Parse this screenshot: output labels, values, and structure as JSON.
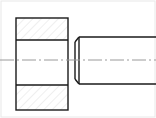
{
  "image": {
    "width": 156,
    "height": 118,
    "background_color": "#ffffff",
    "kind": "engineering-line-drawing",
    "description": "Mechanical assembly drawing: sectioned bore plate at left, chamfered cylindrical pin at right, sharing a horizontal centre axis"
  },
  "colors": {
    "outline": "#1a1a1a",
    "hatch": "#d8d8d8",
    "centerline": "#9a9a9a",
    "frame": "#e8e8e8",
    "background": "#ffffff"
  },
  "frame": {
    "label": "drawing-border",
    "x": 1,
    "y": 1,
    "width": 154,
    "height": 116,
    "stroke_width": 1
  },
  "centerline": {
    "label": "Centre axis",
    "y": 60,
    "x_start": 0,
    "x_end": 156,
    "style": "dash-dot",
    "stroke_width": 1
  },
  "parts": [
    {
      "id": "sectioned-plate",
      "label": "Sectioned plate with bore",
      "view": "full section",
      "x": 16,
      "y": 18,
      "width": 52,
      "height": 92,
      "stroke_width": 1.4,
      "bands": [
        {
          "id": "upper-section-band",
          "label": "Upper cut material",
          "y": 18,
          "height": 22,
          "hatched": true,
          "hatch_angle_deg": 45
        },
        {
          "id": "bore-band",
          "label": "Bore clearance (not hatched)",
          "y": 40,
          "height": 45,
          "hatched": false
        },
        {
          "id": "lower-section-band",
          "label": "Lower cut material",
          "y": 85,
          "height": 25,
          "hatched": true,
          "hatch_angle_deg": 45
        }
      ],
      "divider_lines_y": [
        40,
        85
      ]
    },
    {
      "id": "chamfered-pin",
      "label": "Cylindrical pin with chamfered end",
      "view": "outside view",
      "x_left": 79,
      "x_right": 156,
      "y_top": 37,
      "y_bottom": 84,
      "stroke_width": 1.4,
      "chamfer": {
        "label": "Lead-in chamfer",
        "x_tip": 75,
        "y_top_inset": 42,
        "y_bottom_inset": 79,
        "face_x": 79
      }
    }
  ],
  "hatch": {
    "spacing_px": 6,
    "angle_deg": 45,
    "stroke_width": 0.8,
    "color": "#d8d8d8"
  }
}
